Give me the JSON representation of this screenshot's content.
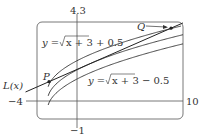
{
  "chart_data": {
    "type": "line",
    "title": "",
    "xlabel": "",
    "ylabel": "",
    "xlim": [
      -4,
      10
    ],
    "ylim": [
      -1,
      4.3
    ],
    "grid": false,
    "range_labels": {
      "x_min": "−4",
      "x_max": "10",
      "y_min": "−1",
      "y_max": "4.3"
    },
    "series": [
      {
        "name": "y = √(x + 3) + 0.5",
        "expr": "sqrt(x+3)+0.5",
        "label_text": "y = √x + 3 + 0.5"
      },
      {
        "name": "y = √(x + 3)",
        "expr": "sqrt(x+3)"
      },
      {
        "name": "y = √(x + 3) − 0.5",
        "expr": "sqrt(x+3)-0.5",
        "label_text": "y = √x + 3 − 0.5"
      },
      {
        "name": "L(x)",
        "expr": "2+(x-1)/4",
        "label_text": "L(x)"
      }
    ],
    "points": [
      {
        "name": "P",
        "x": -2.85,
        "y": 1.04
      },
      {
        "name": "Q",
        "x": 8.85,
        "y": 3.96
      }
    ],
    "annotations": [
      "P",
      "Q",
      "L(x)",
      "y = √x + 3 + 0.5",
      "y = √x + 3 − 0.5"
    ]
  },
  "labels": {
    "y_top": "4.3",
    "y_bottom": "−1",
    "x_left": "−4",
    "x_right": "10",
    "upper_curve": "y = ",
    "upper_curve_rest": "x + 3 + 0.5",
    "lower_curve": "y = ",
    "lower_curve_rest": "x + 3 − 0.5",
    "line": "L(x)",
    "point_p": "P",
    "point_q": "Q"
  }
}
